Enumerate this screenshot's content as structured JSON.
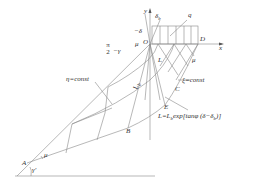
{
  "diagram": {
    "labels": {
      "origin": "O",
      "point_a": "A",
      "point_b": "B",
      "point_c": "C",
      "point_d": "D",
      "point_e": "E",
      "axis_x": "x",
      "axis_y": "y",
      "load": "q",
      "delta_b": "δ",
      "delta_b_sub": "b",
      "neg_delta": "−δ",
      "mu_o": "μ",
      "mu_d": "μ",
      "mu_a": "μ",
      "gamma_prime": "γ'",
      "angle_frac_num": "π",
      "angle_frac_den": "2",
      "angle_minus_gamma": "−γ",
      "eta_const": "η=const",
      "xi_const": "ξ=const",
      "l_small": "L",
      "l_b": "L",
      "l_b_sub": "b",
      "formula": "L=L",
      "formula_sub": "b",
      "formula_rest": "exp[tanφ (δ−δ",
      "formula_sub2": "b",
      "formula_end": ")]"
    }
  }
}
